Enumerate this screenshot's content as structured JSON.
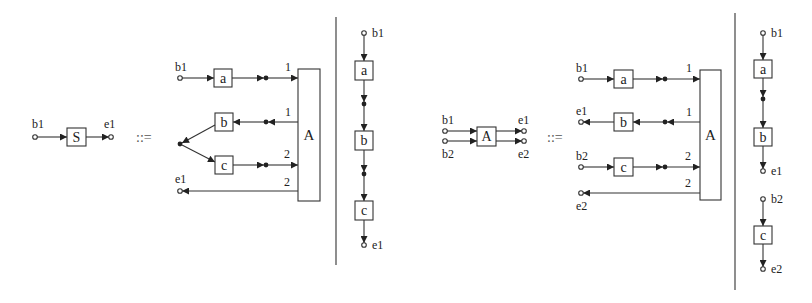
{
  "diagram": {
    "operator": "::=",
    "production1": {
      "lhs": {
        "node": "S",
        "in_port": "b1",
        "out_port": "e1"
      },
      "graph": {
        "start_port": "b1",
        "end_port": "e1",
        "nodes": [
          "a",
          "b",
          "c"
        ],
        "aggregator": "A",
        "edge_labels": [
          "1",
          "1",
          "2",
          "2"
        ]
      },
      "chain": {
        "start_port": "b1",
        "nodes": [
          "a",
          "b",
          "c"
        ],
        "end_port": "e1"
      }
    },
    "production2": {
      "lhs": {
        "node": "A",
        "in_ports": [
          "b1",
          "b2"
        ],
        "out_ports": [
          "e1",
          "e2"
        ]
      },
      "graph": {
        "ports": [
          "b1",
          "e1",
          "b2",
          "e2"
        ],
        "nodes": [
          "a",
          "b",
          "c"
        ],
        "aggregator": "A",
        "edge_labels": [
          "1",
          "1",
          "2",
          "2"
        ]
      },
      "chains": [
        {
          "start_port": "b1",
          "nodes": [
            "a",
            "b"
          ],
          "end_port": "e1"
        },
        {
          "start_port": "b2",
          "nodes": [
            "c"
          ],
          "end_port": "e2"
        }
      ]
    }
  }
}
